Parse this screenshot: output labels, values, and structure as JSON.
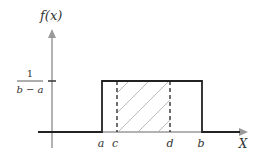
{
  "diagram": {
    "y_axis_label": "f(x)",
    "x_axis_label": "X",
    "height_label": {
      "numerator": "1",
      "denominator": "b − a"
    },
    "x_ticks": [
      "a",
      "c",
      "d",
      "b"
    ],
    "shaded_region": "c to d",
    "colors": {
      "curve": "#222222",
      "axis": "#999999",
      "hatch": "#aaaaaa",
      "text": "#333333"
    }
  }
}
